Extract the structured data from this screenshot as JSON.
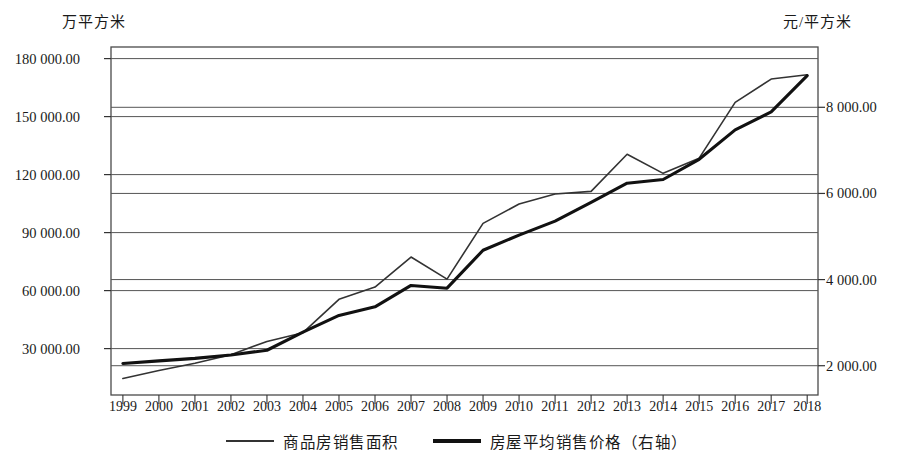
{
  "chart_data": {
    "type": "line",
    "title": "",
    "xlabel": "",
    "ylabel": "万平方米",
    "y2label": "元/平方米",
    "grid": true,
    "legend_position": "bottom",
    "categories": [
      "1999",
      "2000",
      "2001",
      "2002",
      "2003",
      "2004",
      "2005",
      "2006",
      "2007",
      "2008",
      "2009",
      "2010",
      "2011",
      "2012",
      "2013",
      "2014",
      "2015",
      "2016",
      "2017",
      "2018"
    ],
    "left_axis": {
      "unit": "万平方米",
      "ticks": [
        "30 000.00",
        "60 000.00",
        "90 000.00",
        "120 000.00",
        "150 000.00",
        "180 000.00"
      ],
      "tick_values": [
        30000,
        60000,
        90000,
        120000,
        150000,
        180000
      ],
      "ylim": [
        6000,
        186000
      ]
    },
    "right_axis": {
      "unit": "元/平方米",
      "ticks": [
        "2 000.00",
        "4 000.00",
        "6 000.00",
        "8 000.00"
      ],
      "tick_values": [
        2000,
        4000,
        6000,
        8000
      ],
      "ylim": [
        1320,
        9400
      ]
    },
    "series": [
      {
        "name": "商品房销售面积",
        "axis": "left",
        "color": "#333333",
        "stroke_width": 1.6,
        "values": [
          14557,
          18637,
          22412,
          26808,
          33718,
          38232,
          55486,
          61857,
          77355,
          65970,
          94755,
          104765,
          109946,
          111304,
          130551,
          120649,
          128495,
          157349,
          169408,
          171654
        ]
      },
      {
        "name": "房屋平均销售价格（右轴）",
        "axis": "right",
        "color": "#111111",
        "stroke_width": 3.1,
        "values": [
          2053,
          2112,
          2170,
          2250,
          2359,
          2778,
          3168,
          3367,
          3864,
          3800,
          4681,
          5032,
          5357,
          5791,
          6237,
          6324,
          6793,
          7476,
          7892,
          8737
        ]
      }
    ]
  },
  "legend": {
    "items": [
      {
        "label": "商品房销售面积",
        "swatch": "thin-line-swatch"
      },
      {
        "label": "房屋平均销售价格（右轴）",
        "swatch": "thick-line-swatch"
      }
    ]
  }
}
